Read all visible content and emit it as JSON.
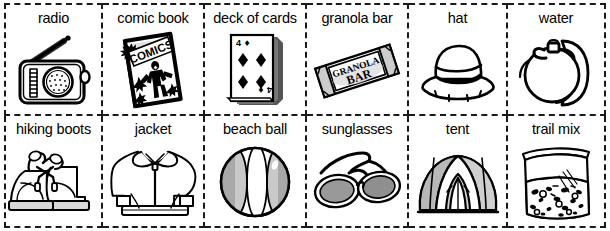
{
  "worksheet": {
    "title": "picture vocabulary card grid",
    "columns": 6,
    "rows": 2,
    "border_style": "dashed",
    "border_color": "#1a1a1a",
    "background_color": "#ffffff",
    "text_color": "#000000"
  },
  "cells": [
    {
      "label": "radio",
      "icon": "radio-icon"
    },
    {
      "label": "comic book",
      "icon": "comic-book-icon",
      "art_text": "COMICS"
    },
    {
      "label": "deck of cards",
      "icon": "deck-of-cards-icon",
      "art_text": "4",
      "art_suit": "♦"
    },
    {
      "label": "granola bar",
      "icon": "granola-bar-icon",
      "art_text_top": "GRANOLA",
      "art_text_bottom": "BAR"
    },
    {
      "label": "hat",
      "icon": "hat-icon"
    },
    {
      "label": "water",
      "icon": "water-canteen-icon"
    },
    {
      "label": "hiking boots",
      "icon": "hiking-boots-icon"
    },
    {
      "label": "jacket",
      "icon": "jacket-icon"
    },
    {
      "label": "beach ball",
      "icon": "beach-ball-icon"
    },
    {
      "label": "sunglasses",
      "icon": "sunglasses-icon"
    },
    {
      "label": "tent",
      "icon": "tent-icon"
    },
    {
      "label": "trail mix",
      "icon": "trail-mix-icon"
    }
  ]
}
